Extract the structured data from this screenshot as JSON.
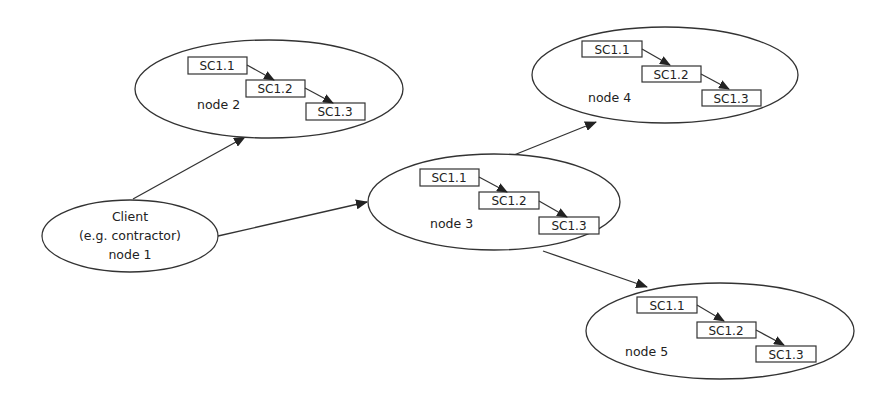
{
  "diagram": {
    "colors": {
      "stroke": "#333333",
      "fill": "#ffffff",
      "text": "#222222"
    },
    "nodes": [
      {
        "id": "node1",
        "lines": [
          "Client",
          "(e.g. contractor)",
          "node 1"
        ],
        "cx": 130,
        "cy": 236,
        "rx": 88,
        "ry": 36
      },
      {
        "id": "node2",
        "label": "node 2",
        "cx": 269,
        "cy": 89,
        "rx": 134,
        "ry": 49,
        "steps": [
          "SC1.1",
          "SC1.2",
          "SC1.3"
        ]
      },
      {
        "id": "node3",
        "label": "node 3",
        "cx": 494,
        "cy": 202,
        "rx": 126,
        "ry": 48,
        "steps": [
          "SC1.1",
          "SC1.2",
          "SC1.3"
        ]
      },
      {
        "id": "node4",
        "label": "node 4",
        "cx": 665,
        "cy": 75,
        "rx": 133,
        "ry": 48,
        "steps": [
          "SC1.1",
          "SC1.2",
          "SC1.3"
        ]
      },
      {
        "id": "node5",
        "label": "node 5",
        "cx": 720,
        "cy": 331,
        "rx": 134,
        "ry": 48,
        "steps": [
          "SC1.1",
          "SC1.2",
          "SC1.3"
        ]
      }
    ],
    "edges": [
      {
        "from": "node1",
        "to": "node2"
      },
      {
        "from": "node1",
        "to": "node3"
      },
      {
        "from": "node3",
        "to": "node4"
      },
      {
        "from": "node3",
        "to": "node5"
      }
    ]
  }
}
